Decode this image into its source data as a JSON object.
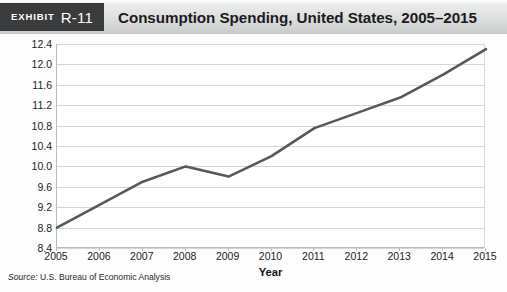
{
  "exhibit": {
    "label": "Exhibit",
    "number": "R-11"
  },
  "header": {
    "title": "Consumption Spending, United States, 2005–2015"
  },
  "source": {
    "label": "Source:",
    "text": " U.S. Bureau of Economic Analysis"
  },
  "colors": {
    "line": "#58585a",
    "grid": "#d4d5d6",
    "axis": "#b9babb",
    "exhibit_tag_bg": "#3a3b3d",
    "header_band": "#dcdddd",
    "text": "#1c1c1e"
  },
  "chart_data": {
    "type": "line",
    "title": "Consumption Spending, United States, 2005–2015",
    "xlabel": "Year",
    "ylabel": "Trillions of Dollars",
    "x": [
      2005,
      2006,
      2007,
      2008,
      2009,
      2010,
      2011,
      2012,
      2013,
      2014,
      2015
    ],
    "x_tick_labels": [
      "2005",
      "2006",
      "2007",
      "2008",
      "2009",
      "2010",
      "2011",
      "2012",
      "2013",
      "2014",
      "2015"
    ],
    "values": [
      8.8,
      9.25,
      9.7,
      10.0,
      9.8,
      10.2,
      10.75,
      11.05,
      11.35,
      11.8,
      12.3
    ],
    "y_ticks": [
      8.4,
      8.8,
      9.2,
      9.6,
      10.0,
      10.4,
      10.8,
      11.2,
      11.6,
      12.0,
      12.4
    ],
    "y_tick_labels": [
      "8.4",
      "8.8",
      "9.2",
      "9.6",
      "10.0",
      "10.4",
      "10.8",
      "11.2",
      "11.6",
      "12.0",
      "12.4"
    ],
    "ylim": [
      8.4,
      12.4
    ],
    "xlim": [
      2005,
      2015
    ],
    "grid": true,
    "legend": false,
    "series": [
      {
        "name": "Consumption Spending",
        "values": [
          8.8,
          9.25,
          9.7,
          10.0,
          9.8,
          10.2,
          10.75,
          11.05,
          11.35,
          11.8,
          12.3
        ]
      }
    ]
  }
}
